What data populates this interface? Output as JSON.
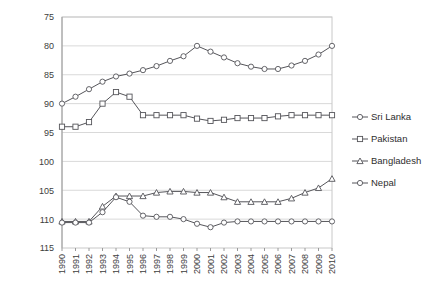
{
  "chart_data": {
    "type": "line",
    "title": "",
    "subtitle": "",
    "xlabel": "",
    "ylabel": "",
    "x": [
      1990,
      1991,
      1992,
      1993,
      1994,
      1995,
      1996,
      1997,
      1998,
      1999,
      2000,
      2001,
      2002,
      2003,
      2004,
      2005,
      2006,
      2007,
      2008,
      2009,
      2010
    ],
    "categories": [
      "1990",
      "1991",
      "1992",
      "1993",
      "1994",
      "1995",
      "1996",
      "1997",
      "1998",
      "1999",
      "2000",
      "2001",
      "2002",
      "2003",
      "2004",
      "2005",
      "2006",
      "2007",
      "2008",
      "2009",
      "2010"
    ],
    "ylim": [
      75,
      115
    ],
    "y_inverted": true,
    "yticks": [
      75,
      80,
      85,
      90,
      95,
      100,
      105,
      110,
      115
    ],
    "grid": true,
    "legend_position": "right",
    "series": [
      {
        "name": "Sri Lanka",
        "marker": "circle",
        "values": [
          90.0,
          88.8,
          87.5,
          86.2,
          85.3,
          84.8,
          84.2,
          83.5,
          82.6,
          81.8,
          80.0,
          81.0,
          82.0,
          83.0,
          83.6,
          84.0,
          84.0,
          83.4,
          82.6,
          81.5,
          80.0
        ]
      },
      {
        "name": "Pakistan",
        "marker": "square",
        "values": [
          94.0,
          94.0,
          93.2,
          90.0,
          88.0,
          88.8,
          92.0,
          92.0,
          92.0,
          92.0,
          92.6,
          93.0,
          92.8,
          92.5,
          92.5,
          92.5,
          92.2,
          92.0,
          92.0,
          92.0,
          92.0
        ]
      },
      {
        "name": "Bangladesh",
        "marker": "triangle",
        "values": [
          110.4,
          110.4,
          110.4,
          107.8,
          106.0,
          106.0,
          106.0,
          105.4,
          105.2,
          105.2,
          105.4,
          105.4,
          106.2,
          107.0,
          107.0,
          107.0,
          107.0,
          106.4,
          105.4,
          104.6,
          103.0
        ]
      },
      {
        "name": "Nepal",
        "marker": "circle",
        "values": [
          110.6,
          110.6,
          110.6,
          108.8,
          106.2,
          107.0,
          109.4,
          109.6,
          109.6,
          110.0,
          110.8,
          111.4,
          110.6,
          110.4,
          110.4,
          110.4,
          110.4,
          110.4,
          110.4,
          110.4,
          110.4
        ]
      }
    ]
  },
  "legend": {
    "items": [
      {
        "label": "Sri Lanka"
      },
      {
        "label": "Pakistan"
      },
      {
        "label": "Bangladesh"
      },
      {
        "label": "Nepal"
      }
    ]
  }
}
